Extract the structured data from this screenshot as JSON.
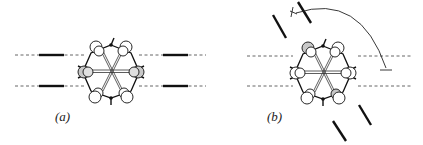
{
  "figure": {
    "panels": [
      {
        "id": "a",
        "label": "(a)",
        "description": "Cyclic molecule with hexagonal-star core aligned between two horizontal dashed lines; straight bars on the dashed lines left and right"
      },
      {
        "id": "b",
        "label": "(b)",
        "description": "Same molecule with bars rotated; curved arrow indicating rotation from the horizontal dashed line to a tilted orientation"
      }
    ],
    "colors": {
      "line": "#111111",
      "dash": "#555555",
      "atom_fill": "#ffffff",
      "atom_shaded": "#c8c8c8"
    }
  }
}
